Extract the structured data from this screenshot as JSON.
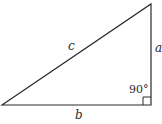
{
  "diagram": {
    "type": "right-triangle",
    "vertices": {
      "bottom_left": [
        2,
        105
      ],
      "top_right": [
        151,
        4
      ],
      "right_angle": [
        151,
        105
      ]
    },
    "labels": {
      "hypotenuse": "c",
      "vertical_leg": "a",
      "horizontal_leg": "b",
      "right_angle": "90°"
    },
    "colors": {
      "stroke": "#2a2a2a",
      "background": "#ffffff"
    }
  }
}
